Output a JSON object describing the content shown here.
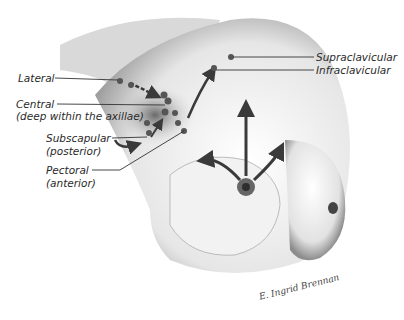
{
  "figure": {
    "labels": {
      "lateral": "Lateral",
      "central": "Central",
      "central_sub": "(deep within the axillae)",
      "subscapular": "Subscapular",
      "subscapular_sub": "(posterior)",
      "pectoral": "Pectoral",
      "pectoral_sub": "(anterior)",
      "supraclavicular": "Supraclavicular",
      "infraclavicular": "Infraclavicular"
    },
    "signature": "E. Ingrid Brennan",
    "colors": {
      "label_text": "#2a2a2a",
      "leader_line": "#333333",
      "node": "#555555",
      "arrow": "#3a3a3a",
      "skin_shadow": "#8a8a8a",
      "background": "#ffffff"
    }
  }
}
